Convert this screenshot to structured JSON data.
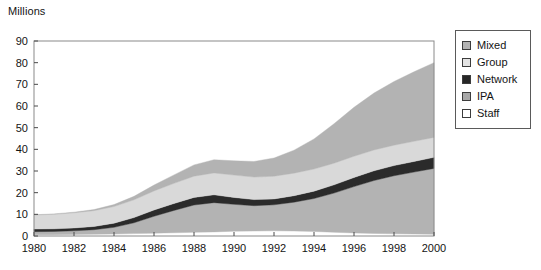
{
  "chart_data": {
    "type": "area",
    "title": "",
    "subtitle": "",
    "xlabel": "",
    "ylabel": "Millions",
    "stacked": true,
    "grid": false,
    "legend_position": "right",
    "xlim": [
      1980,
      2000
    ],
    "ylim": [
      0,
      90
    ],
    "ytick_values": [
      0,
      10,
      20,
      30,
      40,
      50,
      60,
      70,
      80,
      90
    ],
    "ytick_labels": [
      "0",
      "10",
      "20",
      "30",
      "40",
      "50",
      "60",
      "70",
      "80",
      "90"
    ],
    "xtick_values": [
      1980,
      1982,
      1984,
      1986,
      1988,
      1990,
      1992,
      1994,
      1996,
      1998,
      2000
    ],
    "xtick_labels": [
      "1980",
      "1982",
      "1984",
      "1986",
      "1988",
      "1990",
      "1992",
      "1994",
      "1996",
      "1998",
      "2000"
    ],
    "x": [
      1980,
      1981,
      1982,
      1983,
      1984,
      1985,
      1986,
      1987,
      1988,
      1989,
      1990,
      1991,
      1992,
      1993,
      1994,
      1995,
      1996,
      1997,
      1998,
      1999,
      2000
    ],
    "stack_order_bottom_to_top": [
      "Staff",
      "IPA",
      "Network",
      "Group",
      "Mixed"
    ],
    "series": [
      {
        "name": "Staff",
        "color": "#ffffff",
        "values": [
          0.6,
          0.6,
          0.7,
          0.8,
          0.9,
          1.1,
          1.3,
          1.5,
          1.7,
          1.9,
          2.2,
          2.3,
          2.4,
          2.3,
          2.1,
          1.7,
          1.4,
          1.2,
          1.0,
          0.9,
          0.8
        ]
      },
      {
        "name": "IPA",
        "color": "#b3b3b3",
        "values": [
          1.4,
          1.5,
          1.7,
          2.1,
          3.1,
          5.0,
          7.8,
          10.3,
          12.6,
          13.5,
          12.4,
          11.7,
          12.0,
          13.3,
          15.2,
          18.1,
          21.4,
          24.4,
          26.8,
          28.6,
          30.4
        ]
      },
      {
        "name": "Network",
        "color": "#2b2b2b",
        "values": [
          1.2,
          1.2,
          1.3,
          1.5,
          1.9,
          2.4,
          2.9,
          3.2,
          3.5,
          3.6,
          3.2,
          2.8,
          2.7,
          3.0,
          3.4,
          3.8,
          4.2,
          4.5,
          4.7,
          4.9,
          5.1
        ]
      },
      {
        "name": "Group",
        "color": "#d9d9d9",
        "values": [
          6.5,
          6.7,
          7.0,
          7.3,
          7.7,
          8.2,
          8.8,
          9.3,
          9.8,
          10.1,
          10.3,
          10.4,
          10.5,
          10.4,
          10.2,
          10.0,
          9.8,
          9.6,
          9.4,
          9.3,
          9.2
        ]
      },
      {
        "name": "Mixed",
        "color": "#b3b3b3",
        "values": [
          0.1,
          0.2,
          0.3,
          0.5,
          0.9,
          1.6,
          2.7,
          3.9,
          5.2,
          6.1,
          6.6,
          7.2,
          8.4,
          10.6,
          13.9,
          18.2,
          22.6,
          26.3,
          29.4,
          32.1,
          34.5
        ]
      }
    ],
    "totals": [
      9.8,
      10.2,
      11.0,
      12.2,
      14.5,
      18.3,
      23.5,
      28.2,
      32.8,
      35.2,
      34.7,
      34.4,
      36.0,
      39.6,
      44.8,
      51.8,
      59.4,
      66.0,
      71.3,
      75.8,
      80.0
    ]
  },
  "legend": {
    "items": [
      {
        "label": "Mixed",
        "color": "#b3b3b3"
      },
      {
        "label": "Group",
        "color": "#e3e3e3"
      },
      {
        "label": "Network",
        "color": "#262626"
      },
      {
        "label": "IPA",
        "color": "#a8a8a8"
      },
      {
        "label": "Staff",
        "color": "#ffffff"
      }
    ]
  },
  "axis": {
    "y_title": "Millions"
  }
}
